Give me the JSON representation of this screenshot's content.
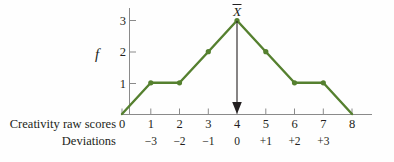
{
  "figure": {
    "background_color": "#fefefe",
    "series_color": "#55802f",
    "axis_color": "#8a8a8a",
    "text_color": "#231f20"
  },
  "axes": {
    "y_axis_label": "f",
    "y_ticks": [
      "1",
      "2",
      "3"
    ],
    "x_ticks": [
      "0",
      "1",
      "2",
      "3",
      "4",
      "5",
      "6",
      "7",
      "8"
    ],
    "row_labels": {
      "scores": "Creativity raw scores",
      "deviations": "Deviations"
    },
    "deviation_ticks": [
      "−3",
      "−2",
      "−1",
      "0",
      "+1",
      "+2",
      "+3"
    ]
  },
  "annotations": {
    "mean_symbol": "X",
    "mean_value": 4,
    "arrow_name": "mean-arrow"
  },
  "chart_data": {
    "type": "line",
    "title": "",
    "xlabel": "Creativity raw scores",
    "ylabel": "f",
    "x": [
      0,
      1,
      2,
      3,
      4,
      5,
      6,
      7,
      8
    ],
    "values": [
      0,
      1,
      1,
      2,
      3,
      2,
      1,
      1,
      0
    ],
    "point_markers_at": [
      1,
      2,
      3,
      4,
      5,
      6,
      7
    ],
    "xlim": [
      0,
      8
    ],
    "ylim": [
      0,
      3
    ],
    "grid": false,
    "legend": null,
    "secondary_x": {
      "label": "Deviations",
      "x": [
        1,
        2,
        3,
        4,
        5,
        6,
        7
      ],
      "tick_labels": [
        "−3",
        "−2",
        "−1",
        "0",
        "+1",
        "+2",
        "+3"
      ]
    },
    "annotations": [
      {
        "type": "arrow",
        "label": "X̄",
        "x": 4,
        "y_from": 3,
        "y_to": 0
      }
    ]
  }
}
